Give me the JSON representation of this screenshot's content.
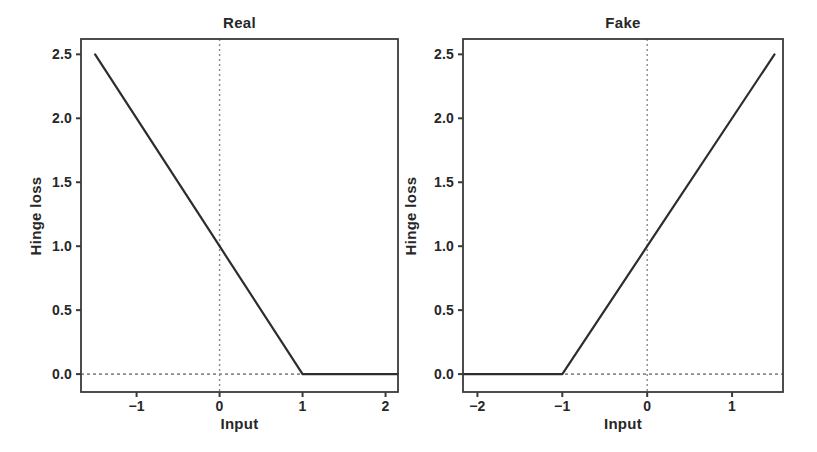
{
  "colors": {
    "background": "#ffffff",
    "frame": "#3a3a3a",
    "data_line": "#2d2d2d",
    "reference_dashed": "#8a8a8a",
    "text": "#272727"
  },
  "chart_data": [
    {
      "type": "line",
      "title": "Real",
      "xlabel": "Input",
      "ylabel": "Hinge loss",
      "xlim": [
        -1.67,
        2.15
      ],
      "ylim": [
        -0.14,
        2.62
      ],
      "grid": false,
      "legend": null,
      "xticks": [
        {
          "value": -1,
          "label": "−1"
        },
        {
          "value": 0,
          "label": "0"
        },
        {
          "value": 1,
          "label": "1"
        },
        {
          "value": 2,
          "label": "2"
        }
      ],
      "yticks": [
        {
          "value": 0.0,
          "label": "0.0"
        },
        {
          "value": 0.5,
          "label": "0.5"
        },
        {
          "value": 1.0,
          "label": "1.0"
        },
        {
          "value": 1.5,
          "label": "1.5"
        },
        {
          "value": 2.0,
          "label": "2.0"
        },
        {
          "value": 2.5,
          "label": "2.5"
        }
      ],
      "series": [
        {
          "name": "hinge-loss-real",
          "description": "max(0, 1 - x): 2.5 at x=-1.5, crosses 1.0 at x=0, reaches 0 at x=1, flat at 0 afterwards",
          "points": [
            [
              -1.5,
              2.5
            ],
            [
              0,
              1.0
            ],
            [
              1,
              0.0
            ],
            [
              2.15,
              0.0
            ]
          ]
        }
      ],
      "reference_lines": [
        {
          "orientation": "vertical",
          "x": 0,
          "style": "dotted"
        },
        {
          "orientation": "horizontal",
          "y": 0,
          "style": "dotted"
        }
      ]
    },
    {
      "type": "line",
      "title": "Fake",
      "xlabel": "Input",
      "ylabel": "Hinge loss",
      "xlim": [
        -2.17,
        1.6
      ],
      "ylim": [
        -0.14,
        2.62
      ],
      "grid": false,
      "legend": null,
      "xticks": [
        {
          "value": -2,
          "label": "−2"
        },
        {
          "value": -1,
          "label": "−1"
        },
        {
          "value": 0,
          "label": "0"
        },
        {
          "value": 1,
          "label": "1"
        }
      ],
      "yticks": [
        {
          "value": 0.0,
          "label": "0.0"
        },
        {
          "value": 0.5,
          "label": "0.5"
        },
        {
          "value": 1.0,
          "label": "1.0"
        },
        {
          "value": 1.5,
          "label": "1.5"
        },
        {
          "value": 2.0,
          "label": "2.0"
        },
        {
          "value": 2.5,
          "label": "2.5"
        }
      ],
      "series": [
        {
          "name": "hinge-loss-fake",
          "description": "max(0, 1 + x): flat at 0 until x=-1, crosses 1.0 at x=0, reaches 2.5 at x=1.5",
          "points": [
            [
              -2.17,
              0.0
            ],
            [
              -1,
              0.0
            ],
            [
              0,
              1.0
            ],
            [
              1.5,
              2.5
            ]
          ]
        }
      ],
      "reference_lines": [
        {
          "orientation": "vertical",
          "x": 0,
          "style": "dotted"
        },
        {
          "orientation": "horizontal",
          "y": 0,
          "style": "dotted"
        }
      ]
    }
  ]
}
